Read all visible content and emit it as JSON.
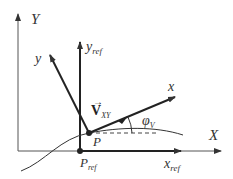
{
  "diagram": {
    "type": "coordinate-frames",
    "labels": {
      "global_y": "Y",
      "global_x": "X",
      "ref_y": "y",
      "ref_y_sub": "ref",
      "ref_x": "x",
      "ref_x_sub": "ref",
      "body_y": "y",
      "body_x": "x",
      "velocity": "V",
      "velocity_sub": "XY",
      "velocity_arrow": "→",
      "angle": "φ",
      "angle_sub": "V",
      "point_p": "P",
      "point_pref": "P",
      "point_pref_sub": "ref"
    },
    "colors": {
      "stroke": "#333333",
      "background": "#ffffff"
    }
  }
}
